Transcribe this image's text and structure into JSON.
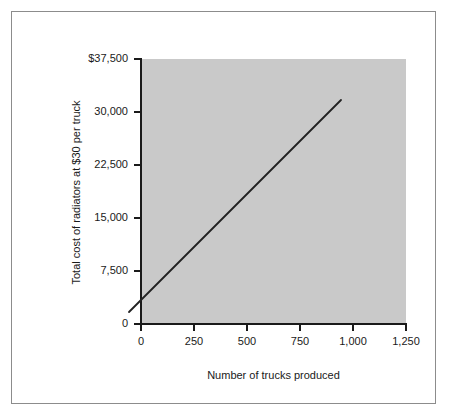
{
  "chart_data": {
    "type": "line",
    "title": "",
    "subtitle": "",
    "xlabel": "Number of trucks produced",
    "ylabel": "Total cost of radiators at $30 per truck",
    "xlim": [
      0,
      1250
    ],
    "ylim": [
      0,
      37500
    ],
    "grid": false,
    "legend": null,
    "x_ticks": [
      0,
      250,
      500,
      750,
      1000,
      1250
    ],
    "x_tick_labels": [
      "0",
      "250",
      "500",
      "750",
      "1,000",
      "1,250"
    ],
    "y_ticks": [
      0,
      7500,
      15000,
      22500,
      30000,
      37500
    ],
    "y_tick_labels": [
      "0",
      "7,500",
      "15,000",
      "22,500",
      "30,000",
      "$37,500"
    ],
    "plot_background": "#c9c9c9",
    "line_color": "#222222",
    "series": [
      {
        "name": "Total radiator cost",
        "x": [
          0,
          1000
        ],
        "y": [
          0,
          30000
        ],
        "points": [
          {
            "x": 0,
            "y": 0
          },
          {
            "x": 250,
            "y": 7500
          },
          {
            "x": 500,
            "y": 15000
          },
          {
            "x": 750,
            "y": 22500
          },
          {
            "x": 1000,
            "y": 30000
          }
        ]
      }
    ]
  },
  "axes": {
    "x_title": "Number of trucks produced",
    "y_title": "Total cost of radiators at $30 per truck",
    "x_tick_labels": [
      "0",
      "250",
      "500",
      "750",
      "1,000",
      "1,250"
    ],
    "y_tick_labels": [
      "$37,500",
      "30,000",
      "22,500",
      "15,000",
      "7,500",
      "0"
    ]
  }
}
